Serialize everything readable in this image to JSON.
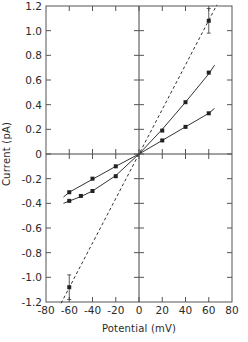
{
  "chart_data": {
    "type": "line",
    "title": "",
    "xlabel": "Potential (mV)",
    "ylabel": "Current (pA)",
    "xlim": [
      -80,
      80
    ],
    "ylim": [
      -1.2,
      1.2
    ],
    "xticks": [
      -80,
      -60,
      -40,
      -20,
      0,
      20,
      40,
      60,
      80
    ],
    "yticks": [
      -1.2,
      -1.0,
      -0.8,
      -0.6,
      -0.4,
      -0.2,
      0,
      0.2,
      0.4,
      0.6,
      0.8,
      1.0,
      1.2
    ],
    "xtick_labels": [
      "-80",
      "-60",
      "-40",
      "-20",
      "0",
      "20",
      "40",
      "60",
      "80"
    ],
    "ytick_labels": [
      "-1.2",
      "-1.0",
      "-0.8",
      "-0.6",
      "-0.4",
      "-0.2",
      "0",
      "0.2",
      "0.4",
      "0.6",
      "0.8",
      "1.0",
      "1.2"
    ],
    "grid": false,
    "legend": null,
    "series": [
      {
        "name": "steep solid curve",
        "style": "solid",
        "marker": "square",
        "x": [
          -60,
          -50,
          -40,
          -20,
          20,
          40,
          60
        ],
        "y": [
          -0.38,
          -0.34,
          -0.3,
          -0.18,
          0.19,
          0.42,
          0.66
        ],
        "fit_x": [
          -65,
          -50,
          -40,
          -20,
          0,
          20,
          40,
          60,
          65
        ],
        "fit_y": [
          -0.4,
          -0.345,
          -0.3,
          -0.175,
          0,
          0.2,
          0.42,
          0.65,
          0.72
        ]
      },
      {
        "name": "shallow solid curve",
        "style": "solid",
        "marker": "square",
        "x": [
          -60,
          -40,
          -20,
          20,
          40,
          60
        ],
        "y": [
          -0.31,
          -0.2,
          -0.1,
          0.11,
          0.22,
          0.33
        ],
        "fit_x": [
          -65,
          -60,
          -40,
          -20,
          0,
          20,
          40,
          60,
          65
        ],
        "fit_y": [
          -0.35,
          -0.31,
          -0.205,
          -0.1,
          0,
          0.11,
          0.22,
          0.33,
          0.37
        ]
      },
      {
        "name": "dashed linear",
        "style": "dashed",
        "marker": "square",
        "x": [
          -60,
          60
        ],
        "y": [
          -1.08,
          1.08
        ],
        "error": [
          0.1,
          0.1
        ],
        "fit_x": [
          -67,
          67
        ],
        "fit_y": [
          -1.21,
          1.21
        ]
      }
    ]
  }
}
